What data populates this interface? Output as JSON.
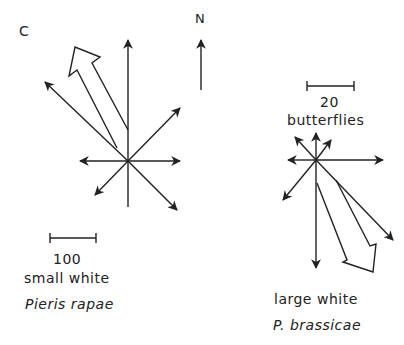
{
  "panel_label": "C",
  "north_label": "N",
  "left_rose": {
    "scale_value": "100",
    "common_name": "small white",
    "species": "Pieris rapae",
    "mean_direction": "NNW"
  },
  "right_rose": {
    "scale_value": "20",
    "scale_unit": "butterflies",
    "common_name": "large white",
    "species": "P. brassicae",
    "mean_direction": "SSE"
  },
  "colors": {
    "ink": "#222222",
    "background": "#ffffff"
  }
}
